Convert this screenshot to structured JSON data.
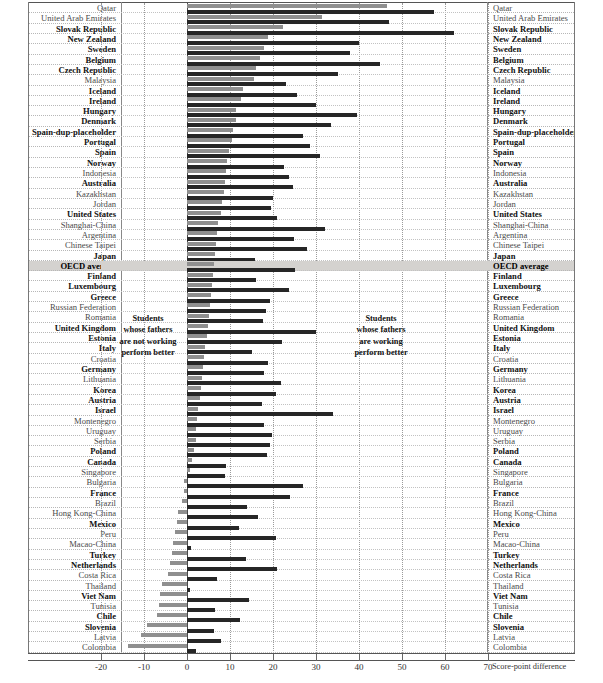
{
  "chart_data": {
    "type": "bar",
    "orientation": "horizontal",
    "title": "",
    "xlabel": "Score-point difference",
    "ylabel": "",
    "xlim": [
      -20,
      70
    ],
    "xticks": [
      -20,
      -10,
      0,
      10,
      20,
      30,
      40,
      50,
      60,
      70
    ],
    "grid": true,
    "legend_position": "none",
    "annotations": [
      {
        "id": "left",
        "text": "Students\nwhose fathers\nare not working\nperform better"
      },
      {
        "id": "right",
        "text": "Students\nwhose fathers\nare working\nperform better"
      }
    ],
    "series": [
      {
        "name": "series-1-light",
        "color": "#8f8f8f"
      },
      {
        "name": "series-2-dark",
        "color": "#262626"
      }
    ],
    "categories": [
      "Qatar",
      "United Arab Emirates",
      "Slovak Republic",
      "New Zealand",
      "Sweden",
      "Belgium",
      "Czech Republic",
      "Malaysia",
      "Iceland",
      "Ireland",
      "Hungary",
      "Denmark",
      "Switzerland",
      "Portugal",
      "Spain",
      "Norway",
      "Indonesia",
      "Australia",
      "Kazakhstan",
      "Jordan",
      "United States",
      "Shanghai-China",
      "Argentina",
      "Chinese Taipei",
      "Japan",
      "OECD average",
      "Finland",
      "Luxembourg",
      "Greece",
      "Russian Federation",
      "Romania",
      "United Kingdom",
      "Estonia",
      "Italy",
      "Croatia",
      "Germany",
      "Lithuania",
      "Korea",
      "Austria",
      "Israel",
      "Montenegro",
      "Uruguay",
      "Serbia",
      "Poland",
      "Canada",
      "Singapore",
      "Bulgaria",
      "France",
      "Brazil",
      "Hong Kong-China",
      "Mexico",
      "Peru",
      "Macao-China",
      "Turkey",
      "Netherlands",
      "Costa Rica",
      "Thailand",
      "Viet Nam",
      "Tunisia",
      "Chile",
      "Slovenia",
      "Latvia",
      "Colombia"
    ],
    "rows": [
      {
        "name": "Qatar",
        "oecd": false,
        "average": false,
        "v1": 46.5,
        "v2": 57.5
      },
      {
        "name": "United Arab Emirates",
        "oecd": false,
        "average": false,
        "v1": 31.3,
        "v2": 47.0
      },
      {
        "name": "Slovak Republic",
        "oecd": true,
        "average": false,
        "v1": 22.3,
        "v2": 62.0
      },
      {
        "name": "New Zealand",
        "oecd": true,
        "average": false,
        "v1": 18.8,
        "v2": 40.0
      },
      {
        "name": "Sweden",
        "oecd": true,
        "average": false,
        "v1": 17.8,
        "v2": 38.0
      },
      {
        "name": "Belgium",
        "oecd": true,
        "average": false,
        "v1": 16.9,
        "v2": 44.8
      },
      {
        "name": "Czech Republic",
        "oecd": true,
        "average": false,
        "v1": 16.0,
        "v2": 35.0
      },
      {
        "name": "Malaysia",
        "oecd": false,
        "average": false,
        "v1": 15.6,
        "v2": 23.0
      },
      {
        "name": "Iceland",
        "oecd": true,
        "average": false,
        "v1": 13.0,
        "v2": 25.5
      },
      {
        "name": "Ireland",
        "oecd": true,
        "average": false,
        "v1": 12.5,
        "v2": 30.0
      },
      {
        "name": "Hungary",
        "oecd": true,
        "average": false,
        "v1": 11.5,
        "v2": 39.6
      },
      {
        "name": "Denmark",
        "oecd": true,
        "average": false,
        "v1": 11.3,
        "v2": 33.5
      },
      {
        "name": "Spain-dup-placeholder",
        "oecd": true,
        "average": false,
        "v1": 10.6,
        "v2": 27.0
      },
      {
        "name": "Portugal",
        "oecd": true,
        "average": false,
        "v1": 10.4,
        "v2": 28.5
      },
      {
        "name": "Spain",
        "oecd": true,
        "average": false,
        "v1": 9.8,
        "v2": 31.0
      },
      {
        "name": "Norway",
        "oecd": true,
        "average": false,
        "v1": 9.4,
        "v2": 22.6
      },
      {
        "name": "Indonesia",
        "oecd": false,
        "average": false,
        "v1": 9.0,
        "v2": 23.8
      },
      {
        "name": "Australia",
        "oecd": true,
        "average": false,
        "v1": 8.8,
        "v2": 24.6
      },
      {
        "name": "Kazakhstan",
        "oecd": false,
        "average": false,
        "v1": 8.6,
        "v2": 20.0
      },
      {
        "name": "Jordan",
        "oecd": false,
        "average": false,
        "v1": 8.2,
        "v2": 19.5
      },
      {
        "name": "United States",
        "oecd": true,
        "average": false,
        "v1": 7.8,
        "v2": 21.0
      },
      {
        "name": "Shanghai-China",
        "oecd": false,
        "average": false,
        "v1": 7.3,
        "v2": 32.0
      },
      {
        "name": "Argentina",
        "oecd": false,
        "average": false,
        "v1": 7.0,
        "v2": 24.8
      },
      {
        "name": "Chinese Taipei",
        "oecd": false,
        "average": false,
        "v1": 6.8,
        "v2": 28.0
      },
      {
        "name": "Japan",
        "oecd": true,
        "average": false,
        "v1": 6.5,
        "v2": 15.8
      },
      {
        "name": "OECD average",
        "oecd": false,
        "average": true,
        "v1": 6.2,
        "v2": 25.0
      },
      {
        "name": "Finland",
        "oecd": true,
        "average": false,
        "v1": 6.0,
        "v2": 16.0
      },
      {
        "name": "Luxembourg",
        "oecd": true,
        "average": false,
        "v1": 5.8,
        "v2": 23.8
      },
      {
        "name": "Greece",
        "oecd": true,
        "average": false,
        "v1": 5.6,
        "v2": 19.4
      },
      {
        "name": "Russian Federation",
        "oecd": false,
        "average": false,
        "v1": 5.4,
        "v2": 18.4
      },
      {
        "name": "Romania",
        "oecd": false,
        "average": false,
        "v1": 5.2,
        "v2": 17.6
      },
      {
        "name": "United Kingdom",
        "oecd": true,
        "average": false,
        "v1": 4.8,
        "v2": 30.0
      },
      {
        "name": "Estonia",
        "oecd": true,
        "average": false,
        "v1": 4.6,
        "v2": 22.0
      },
      {
        "name": "Italy",
        "oecd": true,
        "average": false,
        "v1": 4.2,
        "v2": 15.0
      },
      {
        "name": "Croatia",
        "oecd": false,
        "average": false,
        "v1": 4.0,
        "v2": 18.8
      },
      {
        "name": "Germany",
        "oecd": true,
        "average": false,
        "v1": 3.8,
        "v2": 18.0
      },
      {
        "name": "Lithuania",
        "oecd": false,
        "average": false,
        "v1": 3.5,
        "v2": 21.8
      },
      {
        "name": "Korea",
        "oecd": true,
        "average": false,
        "v1": 3.2,
        "v2": 20.6
      },
      {
        "name": "Austria",
        "oecd": true,
        "average": false,
        "v1": 3.0,
        "v2": 17.4
      },
      {
        "name": "Israel",
        "oecd": true,
        "average": false,
        "v1": 2.6,
        "v2": 34.0
      },
      {
        "name": "Montenegro",
        "oecd": false,
        "average": false,
        "v1": 2.4,
        "v2": 18.0
      },
      {
        "name": "Uruguay",
        "oecd": false,
        "average": false,
        "v1": 2.2,
        "v2": 19.8
      },
      {
        "name": "Serbia",
        "oecd": false,
        "average": false,
        "v1": 2.0,
        "v2": 19.2
      },
      {
        "name": "Poland",
        "oecd": true,
        "average": false,
        "v1": 1.6,
        "v2": 18.6
      },
      {
        "name": "Canada",
        "oecd": true,
        "average": false,
        "v1": 1.2,
        "v2": 9.0
      },
      {
        "name": "Singapore",
        "oecd": false,
        "average": false,
        "v1": 0.8,
        "v2": 8.8
      },
      {
        "name": "Bulgaria",
        "oecd": false,
        "average": false,
        "v1": -0.6,
        "v2": 27.0
      },
      {
        "name": "France",
        "oecd": true,
        "average": false,
        "v1": -0.8,
        "v2": 24.0
      },
      {
        "name": "Brazil",
        "oecd": false,
        "average": false,
        "v1": -1.2,
        "v2": 14.0
      },
      {
        "name": "Hong Kong-China",
        "oecd": false,
        "average": false,
        "v1": -2.0,
        "v2": 16.5
      },
      {
        "name": "Mexico",
        "oecd": true,
        "average": false,
        "v1": -2.4,
        "v2": 12.2
      },
      {
        "name": "Peru",
        "oecd": false,
        "average": false,
        "v1": -2.8,
        "v2": 20.8
      },
      {
        "name": "Macao-China",
        "oecd": false,
        "average": false,
        "v1": -3.2,
        "v2": 1.0
      },
      {
        "name": "Turkey",
        "oecd": true,
        "average": false,
        "v1": -3.6,
        "v2": 13.8
      },
      {
        "name": "Netherlands",
        "oecd": true,
        "average": false,
        "v1": -4.0,
        "v2": 21.0
      },
      {
        "name": "Costa Rica",
        "oecd": false,
        "average": false,
        "v1": -4.4,
        "v2": 7.0
      },
      {
        "name": "Thailand",
        "oecd": false,
        "average": false,
        "v1": -5.8,
        "v2": 0.8
      },
      {
        "name": "Viet Nam",
        "oecd": true,
        "average": false,
        "v1": -6.2,
        "v2": 14.4
      },
      {
        "name": "Tunisia",
        "oecd": false,
        "average": false,
        "v1": -6.6,
        "v2": 6.6
      },
      {
        "name": "Chile",
        "oecd": true,
        "average": false,
        "v1": -7.0,
        "v2": 12.4
      },
      {
        "name": "Slovenia",
        "oecd": true,
        "average": false,
        "v1": -9.2,
        "v2": 6.2
      },
      {
        "name": "Latvia",
        "oecd": false,
        "average": false,
        "v1": -10.6,
        "v2": 7.8
      },
      {
        "name": "Colombia",
        "oecd": false,
        "average": false,
        "v1": -13.8,
        "v2": 2.0
      }
    ]
  },
  "axis": {
    "title": "Score-point difference",
    "ticks": [
      "-20",
      "-10",
      "0",
      "10",
      "20",
      "30",
      "40",
      "50",
      "60",
      "70"
    ]
  },
  "annotation_left": {
    "line1": "Students",
    "line2": "whose fathers",
    "line3": "are not working",
    "line4": "perform better"
  },
  "annotation_right": {
    "line1": "Students",
    "line2": "whose fathers",
    "line3": "are working",
    "line4": "perform better"
  }
}
